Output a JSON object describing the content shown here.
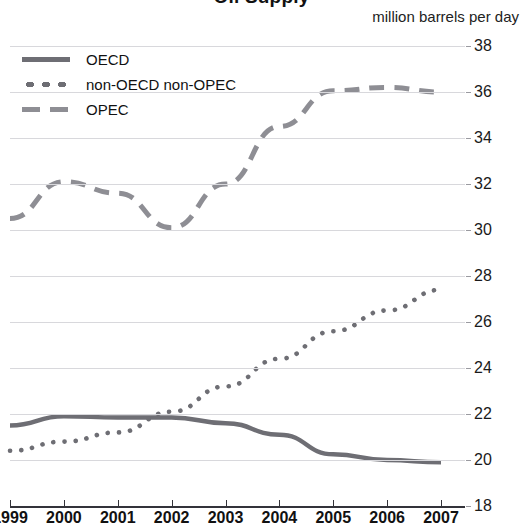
{
  "chart_title": "Oil Supply",
  "units_caption": "million barrels per day",
  "legend": {
    "items": [
      {
        "label": "OECD",
        "style": "solid",
        "color": "#6e6e74",
        "swatch_icon": "solid-line-swatch"
      },
      {
        "label": "non-OECD non-OPEC",
        "style": "dotted",
        "color": "#6e6e74",
        "swatch_icon": "dotted-line-swatch"
      },
      {
        "label": "OPEC",
        "style": "dashed",
        "color": "#8e8e94",
        "swatch_icon": "dashed-line-swatch"
      }
    ]
  },
  "axes": {
    "y_ticks": [
      38,
      36,
      34,
      32,
      30,
      28,
      26,
      24,
      22,
      20,
      18
    ],
    "x_ticks": [
      "1999",
      "2000",
      "2001",
      "2002",
      "2003",
      "2004",
      "2005",
      "2006",
      "2007"
    ]
  },
  "chart_data": {
    "type": "line",
    "title": "Oil Supply",
    "subtitle": "",
    "xlabel": "",
    "ylabel": "million barrels per day",
    "x": [
      1999,
      2000,
      2001,
      2002,
      2003,
      2004,
      2005,
      2006,
      2007
    ],
    "categories": [
      "1999",
      "2000",
      "2001",
      "2002",
      "2003",
      "2004",
      "2005",
      "2006",
      "2007"
    ],
    "xlim": [
      1999,
      2007
    ],
    "ylim": [
      18,
      38
    ],
    "y_tick_step": 2,
    "grid": true,
    "legend_position": "top-left",
    "series": [
      {
        "name": "OECD",
        "style": "solid",
        "color": "#6e6e74",
        "values": [
          21.5,
          21.9,
          21.85,
          21.85,
          21.6,
          21.1,
          20.25,
          20.0,
          19.9
        ]
      },
      {
        "name": "non-OECD non-OPEC",
        "style": "dotted",
        "color": "#6e6e74",
        "values": [
          20.4,
          20.8,
          21.2,
          22.1,
          23.2,
          24.4,
          25.6,
          26.5,
          27.4
        ]
      },
      {
        "name": "OPEC",
        "style": "dashed",
        "color": "#8e8e94",
        "values": [
          30.5,
          32.1,
          31.6,
          30.1,
          32.0,
          34.5,
          36.05,
          36.2,
          36.0
        ]
      }
    ]
  }
}
